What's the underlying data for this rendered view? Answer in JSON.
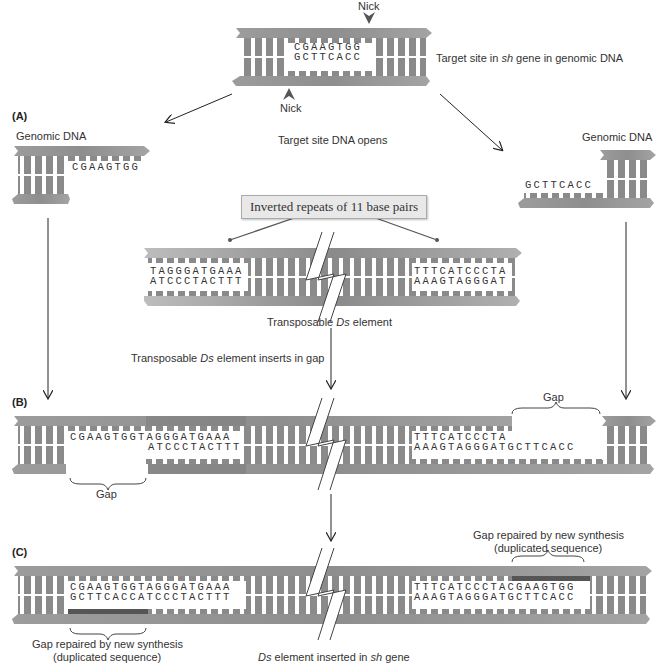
{
  "top": {
    "nick_top": "Nick",
    "nick_bottom": "Nick",
    "seq_top": "CGAAGTGG",
    "seq_bottom": "GCTTCACC",
    "caption_prefix": "Target site in ",
    "caption_gene": "sh",
    "caption_suffix": " gene in genomic DNA"
  },
  "panel_a": {
    "letter": "(A)",
    "left_label": "Genomic DNA",
    "right_label": "Genomic DNA",
    "left_seq": "CGAAGTGG",
    "right_seq": "GCTTCACC",
    "center_label": "Target site DNA opens",
    "callout": "Inverted repeats of 11 base pairs",
    "ds_left_top": "TAGGGATGAAA",
    "ds_left_bottom": "ATCCCTACTTT",
    "ds_right_top": "TTTCATCCCTA",
    "ds_right_bottom": "AAAGTAGGGAT",
    "ds_caption_prefix": "Transposable ",
    "ds_caption_em": "Ds",
    "ds_caption_suffix": " element",
    "insert_caption_prefix": "Transposable ",
    "insert_caption_em": "Ds",
    "insert_caption_suffix": " element inserts in gap"
  },
  "panel_b": {
    "letter": "(B)",
    "left_top": "CGAAGTGGTAGGGATGAAA",
    "left_bottom": "ATCCCTACTTT",
    "right_top": "TTTCATCCCTA",
    "right_bottom": "AAAGTAGGGATGCTTCACC",
    "gap_left": "Gap",
    "gap_right": "Gap"
  },
  "panel_c": {
    "letter": "(C)",
    "left_top": "CGAAGTGGTAGGGATGAAA",
    "left_bottom": "GCTTCACCATCCCTACTTT",
    "right_top": "TTTCATCCCTACGAAGTGG",
    "right_bottom": "AAAGTAGGGATGCTTCACC",
    "repair_left_line1": "Gap repaired by new synthesis",
    "repair_left_line2": "(duplicated sequence)",
    "repair_right_line1": "Gap repaired by new synthesis",
    "repair_right_line2": "(duplicated sequence)",
    "caption_em1": "Ds",
    "caption_mid": " element inserted in ",
    "caption_em2": "sh",
    "caption_suffix": " gene"
  },
  "colors": {
    "backbone": "#9a9a9a",
    "backbone_dark": "#7d7d7d",
    "rung": "#8c8c8c",
    "ds_backbone": "#858585",
    "new_synthesis": "#5e5e5e",
    "arrow": "#222222",
    "callout_bg": "#e8e8e8"
  }
}
